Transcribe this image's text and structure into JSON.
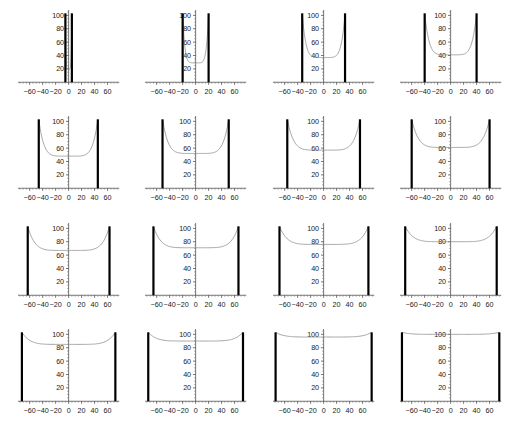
{
  "figure": {
    "kind": "panel-grid",
    "rows": 4,
    "cols": 4,
    "background": "#ffffff",
    "curve_color": "#8a8a8a",
    "wall_color": "#000000",
    "axis_color": "#3a3a3a",
    "text_color": "#1a1a1a"
  },
  "axes": {
    "xlabel": "",
    "ylabel": "",
    "xticks": [
      -60,
      -40,
      -20,
      0,
      20,
      40,
      60
    ],
    "xtick_labels": [
      "-60",
      "-40",
      "-20",
      "0",
      "20",
      "40",
      "60"
    ],
    "yticks": [
      20,
      40,
      60,
      80,
      100
    ],
    "ytick_labels": [
      "20",
      "40",
      "60",
      "80",
      "100"
    ],
    "xlim": [
      -78,
      78
    ],
    "ylim": [
      0,
      108
    ],
    "grid": false,
    "legend": false
  },
  "chart_data": {
    "type": "line",
    "title": "",
    "xlabel": "",
    "ylabel": "",
    "xlim": [
      -78,
      78
    ],
    "ylim": [
      0,
      108
    ],
    "grid": false,
    "legend_position": "none",
    "xticks": [
      -60,
      -40,
      -20,
      0,
      20,
      40,
      60
    ],
    "yticks": [
      20,
      40,
      60,
      80,
      100
    ],
    "panel_count": 16,
    "panels": [
      {
        "index": 1,
        "row": 1,
        "col": 1,
        "wall_left": -5,
        "wall_right": 5,
        "wall_top": 103,
        "curve_min": 20,
        "curve_edge": 103
      },
      {
        "index": 2,
        "row": 1,
        "col": 2,
        "wall_left": -20,
        "wall_right": 20,
        "wall_top": 103,
        "curve_min": 29,
        "curve_edge": 103
      },
      {
        "index": 3,
        "row": 1,
        "col": 3,
        "wall_left": -33,
        "wall_right": 33,
        "wall_top": 103,
        "curve_min": 37,
        "curve_edge": 103
      },
      {
        "index": 4,
        "row": 1,
        "col": 4,
        "wall_left": -40,
        "wall_right": 40,
        "wall_top": 103,
        "curve_min": 41,
        "curve_edge": 103
      },
      {
        "index": 5,
        "row": 2,
        "col": 1,
        "wall_left": -46,
        "wall_right": 45,
        "wall_top": 103,
        "curve_min": 48,
        "curve_edge": 103
      },
      {
        "index": 6,
        "row": 2,
        "col": 2,
        "wall_left": -51,
        "wall_right": 51,
        "wall_top": 103,
        "curve_min": 52,
        "curve_edge": 103
      },
      {
        "index": 7,
        "row": 2,
        "col": 3,
        "wall_left": -56,
        "wall_right": 56,
        "wall_top": 103,
        "curve_min": 57,
        "curve_edge": 103
      },
      {
        "index": 8,
        "row": 2,
        "col": 4,
        "wall_left": -60,
        "wall_right": 60,
        "wall_top": 103,
        "curve_min": 61,
        "curve_edge": 103
      },
      {
        "index": 9,
        "row": 3,
        "col": 1,
        "wall_left": -63,
        "wall_right": 63,
        "wall_top": 103,
        "curve_min": 67,
        "curve_edge": 103
      },
      {
        "index": 10,
        "row": 3,
        "col": 2,
        "wall_left": -65,
        "wall_right": 66,
        "wall_top": 103,
        "curve_min": 71,
        "curve_edge": 103
      },
      {
        "index": 11,
        "row": 3,
        "col": 3,
        "wall_left": -68,
        "wall_right": 69,
        "wall_top": 103,
        "curve_min": 76,
        "curve_edge": 103
      },
      {
        "index": 12,
        "row": 3,
        "col": 4,
        "wall_left": -70,
        "wall_right": 71,
        "wall_top": 103,
        "curve_min": 80,
        "curve_edge": 103
      },
      {
        "index": 13,
        "row": 4,
        "col": 1,
        "wall_left": -72,
        "wall_right": 72,
        "wall_top": 103,
        "curve_min": 85,
        "curve_edge": 103
      },
      {
        "index": 14,
        "row": 4,
        "col": 2,
        "wall_left": -73,
        "wall_right": 73,
        "wall_top": 103,
        "curve_min": 90,
        "curve_edge": 103
      },
      {
        "index": 15,
        "row": 4,
        "col": 3,
        "wall_left": -74,
        "wall_right": 74,
        "wall_top": 103,
        "curve_min": 96,
        "curve_edge": 103
      },
      {
        "index": 16,
        "row": 4,
        "col": 4,
        "wall_left": -75,
        "wall_right": 75,
        "wall_top": 103,
        "curve_min": 100,
        "curve_edge": 103
      }
    ]
  }
}
